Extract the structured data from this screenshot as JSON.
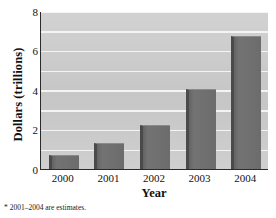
{
  "chart_data": {
    "type": "bar",
    "title": "",
    "subtitle": "",
    "xlabel": "Year",
    "ylabel": "Dollars (trillions)",
    "categories": [
      "2000",
      "2001",
      "2002",
      "2003",
      "2004"
    ],
    "values": [
      0.7,
      1.3,
      2.25,
      4.05,
      6.75
    ],
    "series": [
      {
        "name": "Dollars (trillions)",
        "values": [
          0.7,
          1.3,
          2.25,
          4.05,
          6.75
        ]
      }
    ],
    "ylim": [
      0,
      8
    ],
    "ytick_labels": [
      "0",
      "2",
      "4",
      "6",
      "8"
    ],
    "ytick_values": [
      0,
      2,
      4,
      6,
      8
    ],
    "gridline_values": [
      1,
      2,
      3,
      4,
      5,
      6,
      7,
      8
    ],
    "grid": true,
    "legend": false,
    "legend_position": "none",
    "annotations": [
      "* 2001–2004 are estimates."
    ],
    "colors": {
      "bar_face": "#6e6e6e",
      "bar_edge": "#4a4a4a",
      "plot_background": "#c9c9c9",
      "gridline": "#f4f4f4",
      "axis": "#2b2b2b",
      "text": "#111111",
      "figure_background": "#ffffff"
    }
  },
  "footnote": {
    "text": "* 2001–2004 are estimates."
  }
}
